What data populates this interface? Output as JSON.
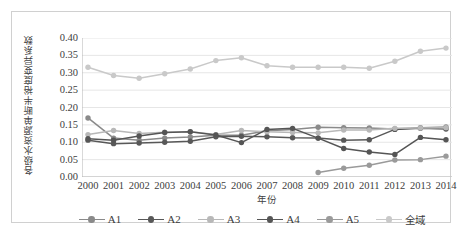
{
  "chart_data": {
    "type": "line",
    "title": "",
    "xlabel": "年份",
    "ylabel": "各级水资源单断半裕度变异系数",
    "categories": [
      "2000",
      "2001",
      "2002",
      "2003",
      "2004",
      "2005",
      "2006",
      "2007",
      "2008",
      "2009",
      "2010",
      "2011",
      "2012",
      "2013",
      "2014"
    ],
    "x": [
      2000,
      2001,
      2002,
      2003,
      2004,
      2005,
      2006,
      2007,
      2008,
      2009,
      2010,
      2011,
      2012,
      2013,
      2014
    ],
    "ylim": [
      0.0,
      0.4
    ],
    "yticks": [
      "0.00",
      "0.05",
      "0.10",
      "0.15",
      "0.20",
      "0.25",
      "0.30",
      "0.35",
      "0.40"
    ],
    "ytick_values": [
      0.0,
      0.05,
      0.1,
      0.15,
      0.2,
      0.25,
      0.3,
      0.35,
      0.4
    ],
    "grid": true,
    "grid_axis": "y",
    "legend_position": "bottom",
    "marker": "circle",
    "series": [
      {
        "name": "A1",
        "color": "#8a8a8a",
        "values": [
          0.17,
          0.112,
          0.106,
          0.112,
          0.115,
          0.12,
          0.12,
          0.133,
          0.137,
          0.143,
          0.142,
          0.141,
          0.138,
          0.142,
          0.144
        ]
      },
      {
        "name": "A2",
        "color": "#585858",
        "values": [
          0.106,
          0.096,
          0.098,
          0.1,
          0.103,
          0.116,
          0.117,
          0.116,
          0.113,
          0.112,
          0.106,
          0.107,
          0.137,
          0.14,
          0.138
        ]
      },
      {
        "name": "A3",
        "color": "#b8b8b8",
        "values": [
          0.122,
          0.134,
          0.125,
          0.129,
          0.13,
          0.122,
          0.134,
          0.13,
          0.128,
          0.127,
          0.135,
          0.135,
          0.14,
          0.141,
          0.142
        ]
      },
      {
        "name": "A4",
        "color": "#555555",
        "values": [
          0.11,
          0.106,
          0.118,
          0.128,
          0.13,
          0.121,
          0.099,
          0.137,
          0.14,
          0.112,
          0.082,
          0.072,
          0.065,
          0.114,
          0.107
        ]
      },
      {
        "name": "A5",
        "color": "#9a9a9a",
        "values": [
          null,
          null,
          null,
          null,
          null,
          null,
          null,
          null,
          null,
          0.013,
          0.025,
          0.034,
          0.049,
          0.05,
          0.06
        ]
      },
      {
        "name": "全域",
        "color": "#c9c9c9",
        "values": [
          0.316,
          0.292,
          0.284,
          0.297,
          0.311,
          0.335,
          0.343,
          0.32,
          0.316,
          0.316,
          0.316,
          0.313,
          0.333,
          0.362,
          0.371
        ]
      }
    ]
  },
  "legend": {
    "items": [
      {
        "label": "A1",
        "color": "#8a8a8a",
        "cjk": false
      },
      {
        "label": "A2",
        "color": "#585858",
        "cjk": false
      },
      {
        "label": "A3",
        "color": "#b8b8b8",
        "cjk": false
      },
      {
        "label": "A4",
        "color": "#555555",
        "cjk": false
      },
      {
        "label": "A5",
        "color": "#9a9a9a",
        "cjk": false
      },
      {
        "label": "全域",
        "color": "#c9c9c9",
        "cjk": true
      }
    ]
  },
  "style": {
    "plot_background": "#ffffff",
    "frame_border": "#d0d0d0",
    "gridline_color": "#e6e6e6",
    "axis_color": "#b4b4b4",
    "text_color": "#404040"
  }
}
